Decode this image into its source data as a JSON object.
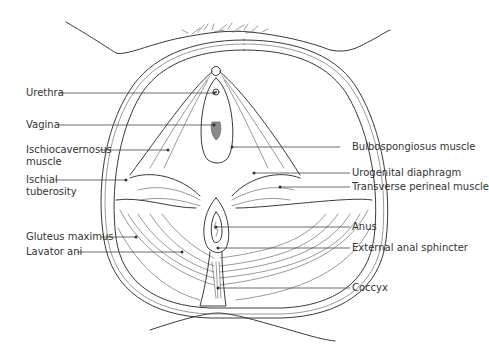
{
  "diagram": {
    "colors": {
      "line": "#3a3a3a",
      "text": "#333333",
      "vagina_fill": "#8a8a8a",
      "background": "#ffffff"
    },
    "labels_left": [
      {
        "id": "urethra",
        "text": "Urethra"
      },
      {
        "id": "vagina",
        "text": "Vagina"
      },
      {
        "id": "ischiocavernosus",
        "text": "Ischiocavernosus",
        "text2": "muscle"
      },
      {
        "id": "ischial-tuberosity",
        "text": "Ischial",
        "text2": "tuberosity"
      },
      {
        "id": "gluteus-maximus",
        "text": "Gluteus maximus"
      },
      {
        "id": "lavator-ani",
        "text": "Lavator ani"
      }
    ],
    "labels_right": [
      {
        "id": "bulbospongiosus",
        "text": "Bulbospongiosus muscle"
      },
      {
        "id": "urogenital-diaphragm",
        "text": "Urogenital diaphragm"
      },
      {
        "id": "transverse-perineal",
        "text": "Transverse perineal muscle"
      },
      {
        "id": "anus",
        "text": "Anus"
      },
      {
        "id": "external-anal-sphincter",
        "text": "External anal sphincter"
      },
      {
        "id": "coccyx",
        "text": "Coccyx"
      }
    ]
  }
}
